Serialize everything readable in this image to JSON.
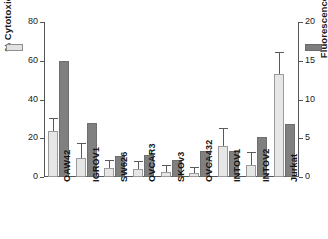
{
  "chart_data": {
    "type": "bar",
    "title": "",
    "xlabel": "",
    "categories": [
      "OAW42",
      "IGROV1",
      "SW626",
      "OVCAR3",
      "SKOv3",
      "OVCA432",
      "INTOV1",
      "INTOV2",
      "Jurkat"
    ],
    "grid": false,
    "legend_position": "outside-top-left-and-right",
    "axes": {
      "left": {
        "label": "% Cytotoxicity",
        "ticks": [
          0,
          20,
          40,
          60,
          80
        ],
        "ticklabels": [
          "0",
          "20",
          "40",
          "60",
          "80"
        ],
        "ylim": [
          0,
          80
        ]
      },
      "right": {
        "label": "Fluorescence Index",
        "ticks": [
          0,
          5,
          10,
          15,
          20
        ],
        "ticklabels": [
          "0",
          "5",
          "10",
          "15",
          "20"
        ],
        "ylim": [
          0,
          20
        ]
      }
    },
    "series": [
      {
        "name": "% Cytotoxicity",
        "axis": "left",
        "color": "#e6e6e6",
        "values": [
          24,
          10,
          4.5,
          4,
          2.5,
          2,
          16,
          6,
          53
        ],
        "errors": [
          6,
          7,
          4,
          4,
          3,
          2.5,
          9,
          6.5,
          11
        ]
      },
      {
        "name": "Fluorescence Index",
        "axis": "right",
        "color": "#808080",
        "values": [
          15.0,
          7.0,
          2.7,
          2.8,
          2.2,
          3.3,
          3.4,
          5.2,
          6.8
        ],
        "errors": [
          0,
          0,
          0,
          0,
          0,
          0,
          0,
          0,
          0
        ]
      }
    ]
  },
  "colors": {
    "light_bar": "#e6e6e6",
    "dark_bar": "#808080",
    "axis": "#555555",
    "text": "#1a1a1a",
    "background": "#ffffff"
  }
}
